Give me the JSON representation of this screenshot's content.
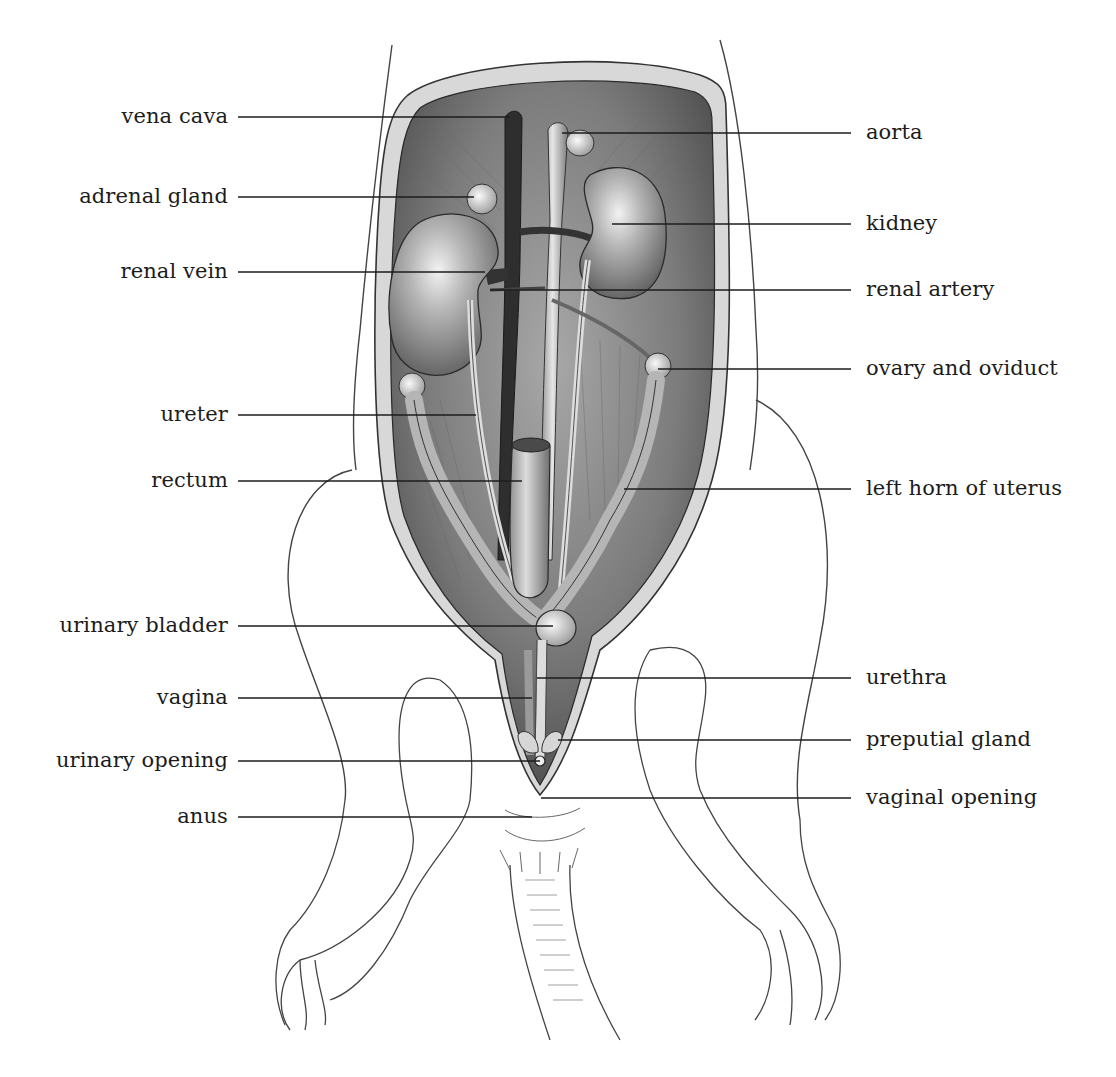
{
  "diagram": {
    "colors": {
      "ink": "#1c1c1c",
      "cavity_dark": "#5a5a5a",
      "cavity_mid": "#8a8a8a",
      "organ_light": "#c9c9c9",
      "paper": "#ffffff"
    },
    "labels_left": [
      {
        "id": "vena-cava",
        "text": "vena cava",
        "y": 117,
        "line_end_x": 510
      },
      {
        "id": "adrenal-gland",
        "text": "adrenal gland",
        "y": 197,
        "line_end_x": 474
      },
      {
        "id": "renal-vein",
        "text": "renal vein",
        "y": 272,
        "line_end_x": 485
      },
      {
        "id": "ureter",
        "text": "ureter",
        "y": 415,
        "line_end_x": 476
      },
      {
        "id": "rectum",
        "text": "rectum",
        "y": 481,
        "line_end_x": 522
      },
      {
        "id": "urinary-bladder",
        "text": "urinary bladder",
        "y": 626,
        "line_end_x": 553
      },
      {
        "id": "vagina",
        "text": "vagina",
        "y": 698,
        "line_end_x": 532
      },
      {
        "id": "urinary-opening",
        "text": "urinary opening",
        "y": 761,
        "line_end_x": 540
      },
      {
        "id": "anus",
        "text": "anus",
        "y": 817,
        "line_end_x": 532
      }
    ],
    "labels_right": [
      {
        "id": "aorta",
        "text": "aorta",
        "y": 133,
        "line_start_x": 562
      },
      {
        "id": "kidney",
        "text": "kidney",
        "y": 224,
        "line_start_x": 612
      },
      {
        "id": "renal-artery",
        "text": "renal artery",
        "y": 290,
        "line_start_x": 490
      },
      {
        "id": "ovary-and-oviduct",
        "text": "ovary and oviduct",
        "y": 369,
        "line_start_x": 658
      },
      {
        "id": "left-horn-of-uterus",
        "text": "left horn of uterus",
        "y": 489,
        "line_start_x": 624
      },
      {
        "id": "urethra",
        "text": "urethra",
        "y": 678,
        "line_start_x": 537
      },
      {
        "id": "preputial-gland",
        "text": "preputial gland",
        "y": 740,
        "line_start_x": 558
      },
      {
        "id": "vaginal-opening",
        "text": "vaginal opening",
        "y": 798,
        "line_start_x": 541
      }
    ]
  }
}
